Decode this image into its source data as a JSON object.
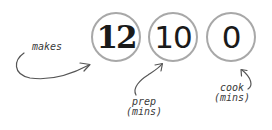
{
  "stats": [
    {
      "value": "12",
      "label": "makes"
    },
    {
      "value": "10",
      "label_line1": "prep",
      "label_line2": "(mins)"
    },
    {
      "value": "0",
      "label_line1": "cook",
      "label_line2": "(mins)"
    }
  ],
  "colors": {
    "circle_border": "#a8a8a8",
    "number": "#1a1a1a",
    "annotation": "#3a3a3a"
  }
}
